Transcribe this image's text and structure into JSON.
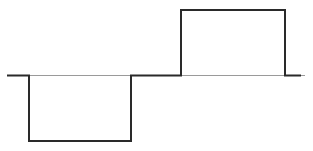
{
  "diagram": {
    "type": "square-wave-pulse",
    "colors": {
      "waveform": "#2a2a2a",
      "baseline": "#888888",
      "background": "#ffffff"
    },
    "baseline_y": 75,
    "segments": [
      {
        "label": "baseline-left",
        "x_start": 7,
        "x_end": 29,
        "level": 0
      },
      {
        "label": "negative-pulse",
        "x_start": 29,
        "x_end": 131,
        "level": -1
      },
      {
        "label": "baseline-middle",
        "x_start": 131,
        "x_end": 181,
        "level": 0
      },
      {
        "label": "positive-pulse",
        "x_start": 181,
        "x_end": 285,
        "level": 1
      },
      {
        "label": "baseline-right",
        "x_start": 285,
        "x_end": 301,
        "level": 0
      }
    ]
  }
}
